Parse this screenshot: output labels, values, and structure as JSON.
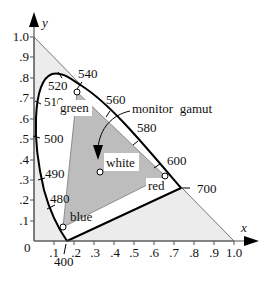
{
  "diagram": {
    "axes": {
      "x": {
        "name": "x",
        "ticks": [
          ".1",
          ".2",
          ".3",
          ".4",
          ".5",
          ".6",
          ".7",
          ".8",
          ".9",
          "1.0"
        ]
      },
      "y": {
        "name": "y",
        "ticks": [
          ".1",
          ".2",
          ".3",
          ".4",
          ".5",
          ".6",
          ".7",
          ".8",
          ".9",
          "1.0"
        ]
      },
      "origin_label": "0"
    },
    "wavelengths": [
      {
        "label": "400",
        "x": 0.173,
        "y": 0.005
      },
      {
        "label": "480",
        "x": 0.091,
        "y": 0.133
      },
      {
        "label": "490",
        "x": 0.045,
        "y": 0.295
      },
      {
        "label": "500",
        "x": 0.008,
        "y": 0.538
      },
      {
        "label": "510",
        "x": 0.014,
        "y": 0.75
      },
      {
        "label": "520",
        "x": 0.074,
        "y": 0.834
      },
      {
        "label": "540",
        "x": 0.23,
        "y": 0.754
      },
      {
        "label": "560",
        "x": 0.373,
        "y": 0.624
      },
      {
        "label": "580",
        "x": 0.512,
        "y": 0.487
      },
      {
        "label": "600",
        "x": 0.627,
        "y": 0.373
      },
      {
        "label": "700",
        "x": 0.735,
        "y": 0.265
      }
    ],
    "primaries": {
      "green": {
        "label": "green",
        "x": 0.21,
        "y": 0.71
      },
      "red": {
        "label": "red",
        "x": 0.64,
        "y": 0.33
      },
      "blue": {
        "label": "blue",
        "x": 0.15,
        "y": 0.06
      },
      "white": {
        "label": "white",
        "x": 0.33,
        "y": 0.34
      }
    },
    "annotation": "monitor  gamut",
    "colors": {
      "gamut_fill": "#bdbdbd",
      "outer_triangle_fill": "#ececec",
      "locus_stroke": "#000000",
      "axis_stroke": "#555555"
    }
  }
}
